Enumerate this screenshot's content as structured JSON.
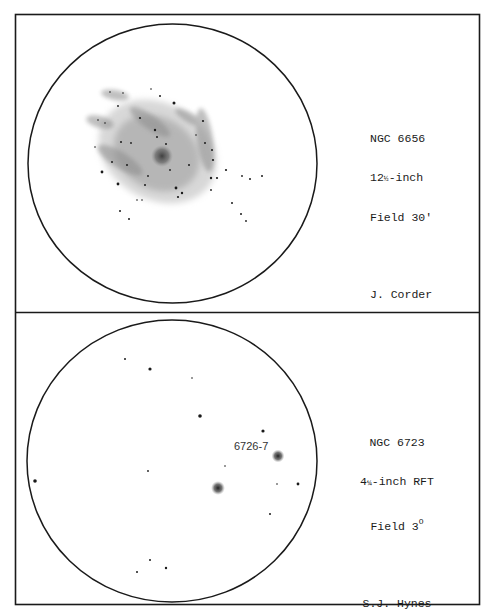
{
  "panels": [
    {
      "object": "NGC 6656",
      "telescope_prefix": "12",
      "telescope_fraction": "½",
      "telescope_suffix": "-inch",
      "field": "Field 30'",
      "observer": "J. Corder"
    },
    {
      "object": "NGC 6723",
      "telescope_prefix": "4",
      "telescope_fraction": "¼",
      "telescope_suffix": "-inch RFT",
      "field_prefix": "Field 3",
      "field_superscript": "O",
      "observer": "S.J. Hynes",
      "annotation": "6726-7"
    }
  ],
  "colors": {
    "ink": "#1a1a1a",
    "nebula": "#9a9a9a",
    "paper": "#ffffff"
  }
}
